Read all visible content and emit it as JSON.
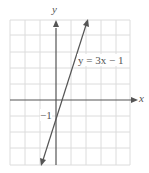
{
  "graph": {
    "equation_label": "y = 3x − 1",
    "x_axis_label": "x",
    "y_axis_label": "y",
    "intercept_label": "−1",
    "slope": 3,
    "intercept": -1,
    "colors": {
      "grid": "#d9d9d9",
      "axis": "#555555",
      "line": "#555555"
    }
  }
}
